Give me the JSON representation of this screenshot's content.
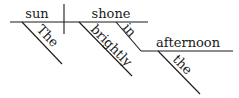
{
  "diagram": {
    "type": "sentence-diagram",
    "sentence": "The sun shone brightly in the afternoon",
    "subject": {
      "label": "sun"
    },
    "verb": {
      "label": "shone"
    },
    "modifiers": {
      "subject_article": {
        "label": "The"
      },
      "adverb": {
        "label": "brightly"
      },
      "preposition": {
        "label": "in"
      },
      "object_of_preposition": {
        "label": "afternoon"
      },
      "object_article": {
        "label": "the"
      }
    },
    "colors": {
      "ink": "#1a1a1a",
      "background": "#ffffff"
    }
  }
}
